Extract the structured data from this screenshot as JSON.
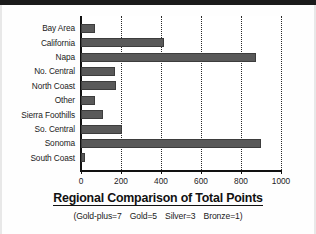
{
  "chart_data": {
    "type": "bar",
    "orientation": "horizontal",
    "title": "Regional Comparison of Total Points",
    "subtitle_parts": [
      "(Gold-plus=7",
      "Gold=5",
      "Silver=3",
      "Bronze=1)"
    ],
    "subtitle": "(Gold-plus=7   Gold=5   Silver=3   Bronze=1)",
    "xlabel": "",
    "ylabel": "",
    "categories": [
      "Bay Area",
      "California",
      "Napa",
      "No. Central",
      "North Coast",
      "Other",
      "Sierra Foothills",
      "So. Central",
      "Sonoma",
      "South Coast"
    ],
    "values": [
      70,
      415,
      875,
      170,
      175,
      70,
      110,
      205,
      900,
      20
    ],
    "xlim": [
      0,
      1000
    ],
    "xticks": [
      0,
      200,
      400,
      600,
      800,
      1000
    ],
    "xtick_labels": [
      "0",
      "200",
      "400",
      "600",
      "800",
      "1000"
    ],
    "grid": "vertical-dotted",
    "legend": "none",
    "bar_color": "#595959",
    "axis_color": "#111111",
    "background_color": "#ffffff"
  }
}
